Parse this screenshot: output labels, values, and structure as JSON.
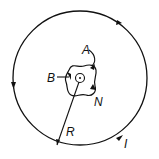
{
  "diagram": {
    "type": "physics-figure",
    "labels": {
      "A": "A",
      "B": "B",
      "N": "N",
      "R": "R",
      "I": "I"
    },
    "colors": {
      "stroke": "#111111",
      "background": "#ffffff"
    },
    "large_circle": {
      "cx": 80,
      "cy": 78,
      "r": 67
    },
    "small_circle": {
      "cx": 80,
      "cy": 78,
      "r": 4
    }
  }
}
